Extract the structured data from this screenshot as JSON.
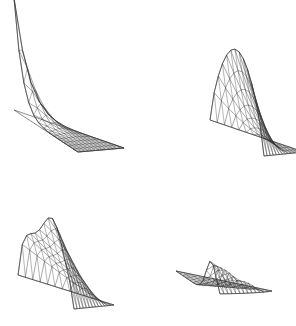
{
  "figure": {
    "background_color": "#ffffff",
    "width": 296,
    "height": 326,
    "line_color": "#333333",
    "base_line_color": "#555555",
    "panel_layout": "2x2 grid of 3D wireframe surface plots"
  },
  "chart_data": [
    {
      "type": "surface",
      "id": "panel-top-left",
      "title": "",
      "xlabel": "",
      "ylabel": "",
      "zlabel": "",
      "domain": "triangle",
      "mesh_divisions": 13,
      "projection": {
        "origin_x": 14,
        "origin_y": 110,
        "u": [
          110,
          38
        ],
        "v": [
          64,
          42
        ],
        "z_scale": -112
      },
      "peak_location": [
        0.02,
        0.02
      ],
      "peak_value": 1.0,
      "surface_kind": "sharp-corner-spike",
      "show_base_triangle": true,
      "zlim": [
        0,
        1
      ],
      "grid": true,
      "legend": "none",
      "annotation": "Sharp singular spike rising at the near-left corner of the triangular domain, decaying rapidly toward the opposite edges."
    },
    {
      "type": "surface",
      "id": "panel-top-right",
      "title": "",
      "xlabel": "",
      "ylabel": "",
      "zlabel": "",
      "domain": "triangle",
      "mesh_divisions": 13,
      "projection": {
        "origin_x": 62,
        "origin_y": 120,
        "u": [
          94,
          32
        ],
        "v": [
          54,
          36
        ],
        "z_scale": -88
      },
      "peak_location": [
        0.25,
        0.3
      ],
      "peak_value": 1.0,
      "surface_kind": "rounded-dome-ridge",
      "show_base_triangle": false,
      "zlim": [
        0,
        1
      ],
      "grid": true,
      "legend": "none",
      "annotation": "Smooth rounded dome / ridge with a broad curved crest over the left portion of the triangular domain."
    },
    {
      "type": "surface",
      "id": "panel-bottom-left",
      "title": "",
      "xlabel": "",
      "ylabel": "",
      "zlabel": "",
      "domain": "triangle",
      "mesh_divisions": 13,
      "projection": {
        "origin_x": 18,
        "origin_y": 112,
        "u": [
          96,
          30
        ],
        "v": [
          56,
          34
        ],
        "z_scale": -70
      },
      "peak_location": [
        0.35,
        0.25
      ],
      "peak_value": 1.0,
      "surface_kind": "broad-wavy-hump",
      "show_base_triangle": false,
      "zlim": [
        0,
        1
      ],
      "grid": true,
      "legend": "none",
      "annotation": "Broad, gently undulating hump with a wavy crest spanning most of the triangular domain."
    },
    {
      "type": "surface",
      "id": "panel-bottom-right",
      "title": "",
      "xlabel": "",
      "ylabel": "",
      "zlabel": "",
      "domain": "triangle",
      "mesh_divisions": 13,
      "projection": {
        "origin_x": 28,
        "origin_y": 108,
        "u": [
          96,
          20
        ],
        "v": [
          44,
          30
        ],
        "z_scale": -34
      },
      "peak_location": [
        0.3,
        0.08
      ],
      "peak_value": 1.0,
      "surface_kind": "low-narrow-ridge",
      "show_base_triangle": false,
      "zlim": [
        0,
        1
      ],
      "grid": true,
      "legend": "none",
      "annotation": "Nearly flat surface with a low narrow dark ridge running along the upper-left edge of the triangular domain."
    }
  ]
}
